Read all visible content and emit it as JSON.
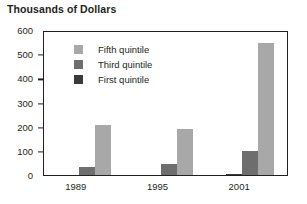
{
  "chart_data": {
    "type": "bar",
    "title": "Thousands of Dollars",
    "xlabel": "",
    "ylabel": "",
    "categories": [
      "1989",
      "1995",
      "2001"
    ],
    "series": [
      {
        "name": "Fifth quintile",
        "color": "#a8a8a8",
        "values": [
          205,
          190,
          545
        ]
      },
      {
        "name": "Third quintile",
        "color": "#6e6e6e",
        "values": [
          35,
          47,
          100
        ]
      },
      {
        "name": "First quintile",
        "color": "#3a3a3a",
        "values": [
          0,
          0,
          6
        ]
      }
    ],
    "ylim": [
      0,
      600
    ],
    "yticks": [
      0,
      100,
      200,
      300,
      400,
      500,
      600
    ],
    "ytick_labels": [
      "0",
      "100",
      "200",
      "300",
      "400",
      "500",
      "600"
    ],
    "grid": false,
    "legend_position": "upper-left-inside"
  },
  "legend": {
    "items": [
      {
        "label": "Fifth quintile",
        "color": "#a8a8a8"
      },
      {
        "label": "Third quintile",
        "color": "#6e6e6e"
      },
      {
        "label": "First quintile",
        "color": "#3a3a3a"
      }
    ]
  },
  "colors": {
    "axis": "#231f20",
    "text": "#231f20",
    "background": "#ffffff"
  }
}
